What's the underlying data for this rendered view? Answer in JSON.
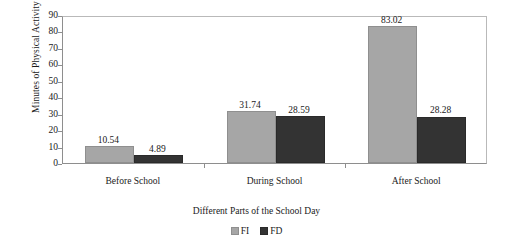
{
  "chart_data": {
    "type": "bar",
    "title": "",
    "xlabel": "Different Parts of the School Day",
    "ylabel": "Minutes of Physical Activity",
    "categories": [
      "Before School",
      "During School",
      "After School"
    ],
    "series": [
      {
        "name": "FI",
        "values": [
          10.54,
          31.74,
          83.02
        ],
        "color": "#a6a6a6"
      },
      {
        "name": "FD",
        "values": [
          4.89,
          28.59,
          28.28
        ],
        "color": "#333333"
      }
    ],
    "value_labels": [
      [
        "10.54",
        "31.74",
        "83.02"
      ],
      [
        "4.89",
        "28.59",
        "28.28"
      ]
    ],
    "ylim": [
      0,
      90
    ],
    "yticks": [
      0,
      10,
      20,
      30,
      40,
      50,
      60,
      70,
      80,
      90
    ],
    "ytick_labels": [
      "0",
      "10",
      "20",
      "30",
      "40",
      "50",
      "60",
      "70",
      "80",
      "90"
    ],
    "grid": false,
    "legend_position": "bottom"
  },
  "legend": {
    "entries": [
      {
        "label": "FI",
        "swatch": "light-gray-square"
      },
      {
        "label": "FD",
        "swatch": "dark-gray-square"
      }
    ]
  },
  "colors": {
    "series_fi": "#a6a6a6",
    "series_fd": "#333333",
    "axis": "#8e8e8e",
    "frame": "#b9b9b9",
    "background": "#ffffff",
    "text": "#1a1a1a"
  }
}
